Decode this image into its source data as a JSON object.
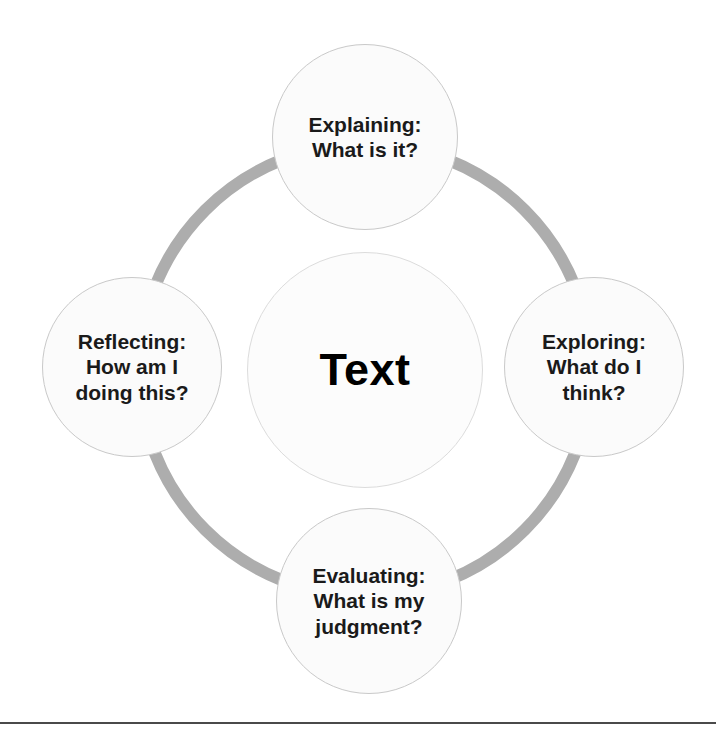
{
  "diagram": {
    "type": "cycle-diagram",
    "center": {
      "label": "Text",
      "name": "center-node"
    },
    "ring": {
      "color": "#adadad",
      "thickness_px": 12
    },
    "node_fill": "#fbfbfb",
    "node_border": "#c9c9c9",
    "text_color": "#1a1a1a",
    "nodes": [
      {
        "id": "explaining",
        "position": "top",
        "label": "Explaining:\nWhat is it?",
        "heading": "Explaining:",
        "question": "What is it?"
      },
      {
        "id": "exploring",
        "position": "right",
        "label": "Exploring:\nWhat do I\nthink?",
        "heading": "Exploring:",
        "question": "What do I think?"
      },
      {
        "id": "evaluating",
        "position": "bottom",
        "label": "Evaluating:\nWhat is my\njudgment?",
        "heading": "Evaluating:",
        "question": "What is my judgment?"
      },
      {
        "id": "reflecting",
        "position": "left",
        "label": "Reflecting:\nHow am I\ndoing this?",
        "heading": "Reflecting:",
        "question": "How am I doing this?"
      }
    ],
    "footer_rule": {
      "color": "#4a4a4a"
    }
  }
}
